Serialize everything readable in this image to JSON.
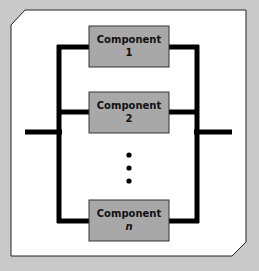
{
  "diagram": {
    "type": "parallel-system-block-diagram",
    "colors": {
      "background": "#c9c9c9",
      "panel": "#ffffff",
      "line": "#000000",
      "component_fill": "#a8a8a8"
    },
    "components": [
      {
        "name": "Component",
        "index": "1"
      },
      {
        "name": "Component",
        "index": "2"
      },
      {
        "name": "Component",
        "index": "n"
      }
    ],
    "ellipsis": "⋮"
  }
}
